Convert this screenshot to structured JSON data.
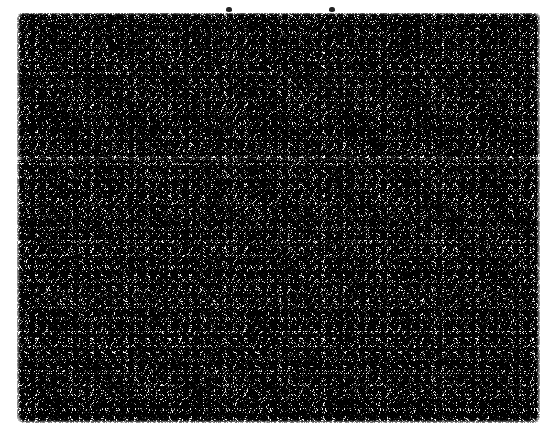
{
  "page": {
    "width": 553,
    "height": 437,
    "background_color": "#ffffff"
  },
  "noise_block": {
    "name": "grayscale salt-and-pepper noise field",
    "description": "Dense random black-and-white dithered speckle occupying a rectangular region of the page; no legible text, figures or structure.",
    "x": 17,
    "y": 13,
    "width": 523,
    "height": 410,
    "base_color": "#b9b9b9",
    "dark_color": "#000000",
    "light_color": "#ffffff"
  },
  "regions": {
    "upper_band": {
      "label": "upper band (marginally darker)",
      "top": 0,
      "height": 144
    },
    "seam": {
      "label": "faint lighter horizontal seam",
      "top": 144,
      "height": 3
    },
    "lower_band": {
      "label": "lower band (marginally denser)",
      "height": 70
    }
  },
  "artifacts": [
    {
      "name": "speck-left",
      "label": "small dark speck",
      "x": 226,
      "y": 7,
      "color": "#232323"
    },
    {
      "name": "speck-right",
      "label": "small dark speck",
      "x": 329,
      "y": 7,
      "color": "#232323"
    }
  ],
  "margins": {
    "left": 17,
    "top": 13,
    "right": 13,
    "bottom": 14,
    "color": "#ffffff"
  }
}
